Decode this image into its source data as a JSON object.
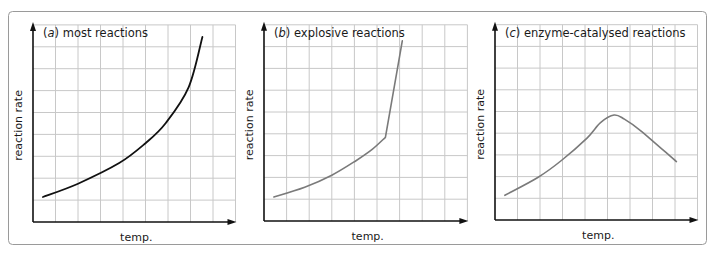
{
  "figure": {
    "frame": {
      "x": 8,
      "y": 11,
      "width": 698,
      "height": 233,
      "radius": 4,
      "stroke": "#9a9a9a"
    },
    "grid_color": "#c8c8c8",
    "axis_color": "#111111"
  },
  "chart_data": [
    {
      "type": "line",
      "panel_id": "a",
      "title_prefix": "(",
      "title_letter": "a",
      "title_suffix": ") most reactions",
      "xlabel": "temp.",
      "ylabel": "reaction rate",
      "grid": true,
      "grid_cells": [
        9,
        9
      ],
      "xlim": [
        0,
        9
      ],
      "ylim": [
        0,
        9
      ],
      "line_color": "#111111",
      "layout": {
        "origin_x": 33,
        "origin_y": 222,
        "cell_w": 22.5,
        "cell_h": 21.9
      },
      "series": [
        {
          "name": "most reactions",
          "points": [
            [
              0.44,
              1.14
            ],
            [
              2.0,
              1.75
            ],
            [
              3.83,
              2.69
            ],
            [
              5.0,
              3.6
            ],
            [
              5.9,
              4.52
            ],
            [
              6.92,
              6.16
            ],
            [
              7.53,
              8.45
            ]
          ]
        }
      ]
    },
    {
      "type": "line",
      "panel_id": "b",
      "title_prefix": "(",
      "title_letter": "b",
      "title_suffix": ") explosive reactions",
      "xlabel": "temp.",
      "ylabel": "reaction rate",
      "grid": true,
      "grid_cells": [
        9,
        9
      ],
      "xlim": [
        0,
        9
      ],
      "ylim": [
        0,
        9
      ],
      "line_color": "#7a7a7a",
      "layout": {
        "origin_x": 264,
        "origin_y": 221,
        "cell_w": 22.6,
        "cell_h": 21.8
      },
      "series": [
        {
          "name": "explosive reactions",
          "points": [
            [
              0.44,
              1.1
            ],
            [
              1.8,
              1.55
            ],
            [
              3.0,
              2.1
            ],
            [
              4.1,
              2.79
            ],
            [
              4.8,
              3.3
            ],
            [
              5.37,
              3.84
            ],
            [
              6.12,
              8.26
            ]
          ]
        }
      ]
    },
    {
      "type": "line",
      "panel_id": "c",
      "title_prefix": "(",
      "title_letter": "c",
      "title_suffix": ") enzyme-catalysed reactions",
      "xlabel": "temp.",
      "ylabel": "reaction rate",
      "grid": true,
      "grid_cells": [
        9,
        9
      ],
      "xlim": [
        0,
        9
      ],
      "ylim": [
        0,
        9
      ],
      "line_color": "#7a7a7a",
      "layout": {
        "origin_x": 495,
        "origin_y": 220,
        "cell_w": 22.5,
        "cell_h": 21.7
      },
      "series": [
        {
          "name": "enzyme-catalysed reactions",
          "points": [
            [
              0.44,
              1.14
            ],
            [
              1.9,
              1.96
            ],
            [
              2.95,
              2.74
            ],
            [
              4.1,
              3.79
            ],
            [
              4.7,
              4.5
            ],
            [
              5.29,
              4.84
            ],
            [
              5.75,
              4.65
            ],
            [
              6.48,
              4.11
            ],
            [
              8.06,
              2.69
            ]
          ]
        }
      ]
    }
  ]
}
